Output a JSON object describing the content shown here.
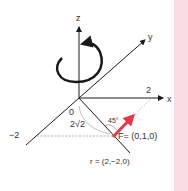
{
  "diagram": {
    "axes": {
      "z_label": "z",
      "y_label": "y",
      "x_label": "x",
      "x_tick": "2",
      "neg_tick": "−2"
    },
    "labels": {
      "origin": "0",
      "distance": "2√2",
      "angle": "45°",
      "force": "F= (0,1,0)",
      "position": "r = (2,−2,0)"
    },
    "icons": {
      "rotation": "counterclockwise-rotation-arrow-icon",
      "force_vector": "force-arrow-icon"
    },
    "colors": {
      "axis": "#1a1a1a",
      "force": "#e8354a",
      "dashed": "#999999",
      "strip": "#f9dde5",
      "text": "#333333"
    }
  }
}
